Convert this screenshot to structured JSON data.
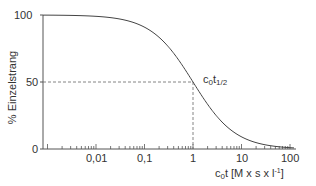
{
  "chart_data": {
    "type": "line",
    "title": "",
    "xlabel": "c0t [M x s x l^-1]",
    "xlabel_parts": {
      "c": "c",
      "sub0": "0",
      "rest": "t [M x s x l",
      "sup": "-1",
      "end": "]"
    },
    "ylabel": "% Einzelstrang",
    "xscale": "log",
    "xlim": [
      0.0008,
      100
    ],
    "ylim": [
      0,
      100
    ],
    "x_ticks": [
      "0,01",
      "0,1",
      "1",
      "10",
      "100"
    ],
    "x_tick_values": [
      0.01,
      0.1,
      1,
      10,
      100
    ],
    "y_ticks": [
      "0",
      "50",
      "100"
    ],
    "y_tick_values": [
      0,
      50,
      100
    ],
    "grid": false,
    "legend": null,
    "series": [
      {
        "name": "% Einzelstrang",
        "x": [
          0.001,
          0.003,
          0.01,
          0.03,
          0.1,
          0.2,
          0.3,
          0.5,
          1,
          2,
          3,
          5,
          10,
          20,
          30,
          50,
          100
        ],
        "values": [
          99.9,
          99.7,
          99.0,
          97.1,
          90.9,
          83.3,
          76.9,
          66.7,
          50.0,
          33.3,
          25.0,
          16.7,
          9.1,
          4.8,
          3.2,
          2.0,
          1.0
        ]
      }
    ],
    "annotations": [
      {
        "text": "c0t1/2",
        "x": 1,
        "y": 50,
        "dashed_guides": true
      }
    ]
  },
  "labels": {
    "y_100": "100",
    "y_50": "50",
    "y_0": "0",
    "x_001": "0,01",
    "x_01": "0,1",
    "x_1": "1",
    "x_10": "10",
    "x_100": "100",
    "ylabel": "% Einzelstrang",
    "annot_c": "c",
    "annot_sub0": "0",
    "annot_t": "t",
    "annot_sub_half": "1/2",
    "xl_c": "c",
    "xl_sub0": "0",
    "xl_rest": "t [M x s x l",
    "xl_sup": "-1",
    "xl_end": "]"
  }
}
